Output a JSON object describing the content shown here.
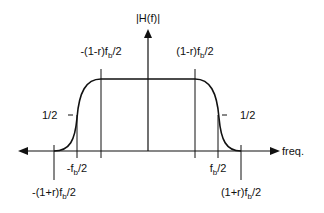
{
  "diagram": {
    "y_axis_label": "|H(f)|",
    "x_axis_label": "freq.",
    "half_level_left": "1/2",
    "half_level_right": "1/2",
    "ticks": {
      "neg_outer": {
        "pre": "-(1+r)f",
        "sub": "b",
        "post": "/2"
      },
      "neg_mid": {
        "pre": "-f",
        "sub": "b",
        "post": "/2"
      },
      "neg_inner": {
        "pre": "-(1-r)f",
        "sub": "b",
        "post": "/2"
      },
      "pos_inner": {
        "pre": "(1-r)f",
        "sub": "b",
        "post": "/2"
      },
      "pos_mid": {
        "pre": "f",
        "sub": "b",
        "post": "/2"
      },
      "pos_outer": {
        "pre": "(1+r)f",
        "sub": "b",
        "post": "/2"
      }
    },
    "colors": {
      "stroke": "#111111",
      "background": "#ffffff"
    }
  }
}
